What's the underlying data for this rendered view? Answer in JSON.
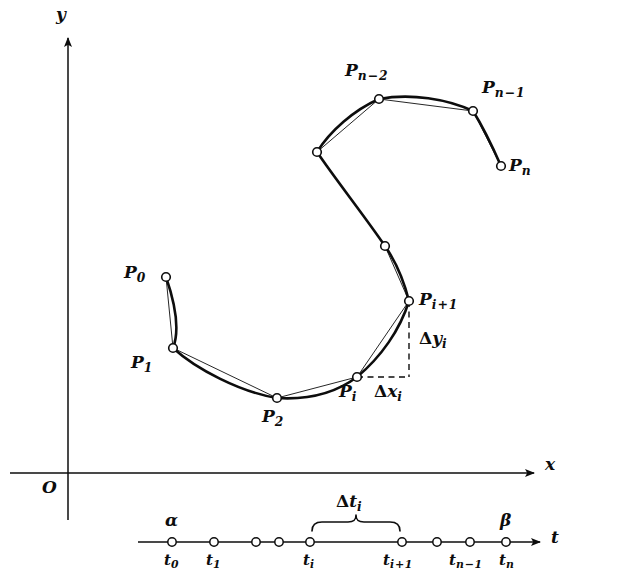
{
  "figure": {
    "ink_color": "#0d0d0d",
    "background": "#ffffff"
  },
  "axes": {
    "y_axis_label": "y",
    "x_axis_label": "x",
    "origin_label": "O",
    "t_axis_label": "t"
  },
  "curve": {
    "point_labels": {
      "p0": "P",
      "p0_sub": "0",
      "p1": "P",
      "p1_sub": "1",
      "p2": "P",
      "p2_sub": "2",
      "pi": "P",
      "pi_sub": "i",
      "pi1_base": "P",
      "pi1_sub_i": "i",
      "pi1_op": "+",
      "pi1_sub_1": "1",
      "pn2_base": "P",
      "pn2_sub_n": "n",
      "pn2_op": "−",
      "pn2_sub_2": "2",
      "pn1_base": "P",
      "pn1_sub_n": "n",
      "pn1_op": "−",
      "pn1_sub_1": "1",
      "pn_base": "P",
      "pn_sub": "n"
    },
    "nodes": [
      {
        "name": "P0",
        "x": 166,
        "y": 277
      },
      {
        "name": "P1",
        "x": 173,
        "y": 348
      },
      {
        "name": "P2",
        "x": 277,
        "y": 398
      },
      {
        "name": "Pi",
        "x": 357,
        "y": 377
      },
      {
        "name": "Pi+1",
        "x": 409,
        "y": 301
      },
      {
        "name": "unlabeled-1",
        "x": 385,
        "y": 246
      },
      {
        "name": "unlabeled-2",
        "x": 317,
        "y": 152
      },
      {
        "name": "Pn-2",
        "x": 379,
        "y": 99
      },
      {
        "name": "Pn-1",
        "x": 473,
        "y": 111
      },
      {
        "name": "Pn",
        "x": 501,
        "y": 166
      }
    ]
  },
  "increments": {
    "delta_y_symbol": "Δ",
    "delta_y_base": "y",
    "delta_y_sub": "i",
    "delta_x_symbol": "Δ",
    "delta_x_base": "x",
    "delta_x_sub": "i",
    "delta_t_symbol": "Δ",
    "delta_t_base": "t",
    "delta_t_sub": "i"
  },
  "t_axis": {
    "alpha": "α",
    "beta": "β",
    "ticks": [
      {
        "label_base": "t",
        "label_sub": "0",
        "x": 172,
        "labeled": true
      },
      {
        "label_base": "t",
        "label_sub": "1",
        "x": 214,
        "labeled": true
      },
      {
        "label_base": "",
        "label_sub": "",
        "x": 256,
        "labeled": false
      },
      {
        "label_base": "",
        "label_sub": "",
        "x": 279,
        "labeled": false
      },
      {
        "label_base": "t",
        "label_sub": "i",
        "x": 310,
        "labeled": true
      },
      {
        "label_base": "t",
        "label_sub": "i",
        "x": 402,
        "labeled": true,
        "op": "+",
        "sub2": "1"
      },
      {
        "label_base": "",
        "label_sub": "",
        "x": 437,
        "labeled": false
      },
      {
        "label_base": "t",
        "label_sub": "n",
        "x": 470,
        "labeled": true,
        "op": "−",
        "sub2": "1"
      },
      {
        "label_base": "t",
        "label_sub": "n",
        "x": 506,
        "labeled": true
      }
    ]
  }
}
